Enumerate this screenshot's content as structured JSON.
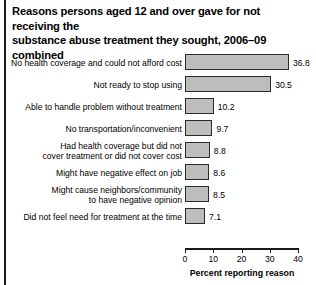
{
  "chart_data": {
    "type": "bar",
    "orientation": "horizontal",
    "title_lines": [
      "Reasons persons aged 12 and over gave for not receiving the",
      "substance abuse treatment they sought, 2006–09 combined"
    ],
    "xlabel": "Percent reporting reason",
    "ylabel": "",
    "xlim": [
      0,
      40
    ],
    "xticks": [
      "0",
      "10",
      "20",
      "30",
      "40"
    ],
    "grid": false,
    "legend": false,
    "bar_color": "#bdbdbd",
    "bar_edge_color": "#2b2b2b",
    "categories": [
      "No health coverage and could not afford cost",
      "Not ready to stop using",
      "Able to handle problem without treatment",
      "No transportation/inconvenient",
      "Had health coverage but did not cover treatment or did not cover cost",
      "Might have negative effect on job",
      "Might cause neighbors/community to have negative opinion",
      "Did not feel need for treatment at the time"
    ],
    "category_lines": [
      [
        "No health coverage and could not afford cost"
      ],
      [
        "Not ready to stop using"
      ],
      [
        "Able to handle problem without treatment"
      ],
      [
        "No transportation/inconvenient"
      ],
      [
        "Had health coverage but did not",
        "cover treatment or did not cover cost"
      ],
      [
        "Might have negative effect on job"
      ],
      [
        "Might cause neighbors/community",
        "to have negative opinion"
      ],
      [
        "Did not feel need for treatment at the time"
      ]
    ],
    "values": [
      36.8,
      30.5,
      10.2,
      9.7,
      8.8,
      8.6,
      8.5,
      7.1
    ],
    "value_labels": [
      "36.8",
      "30.5",
      "10.2",
      "9.7",
      "8.8",
      "8.6",
      "8.5",
      "7.1"
    ]
  }
}
